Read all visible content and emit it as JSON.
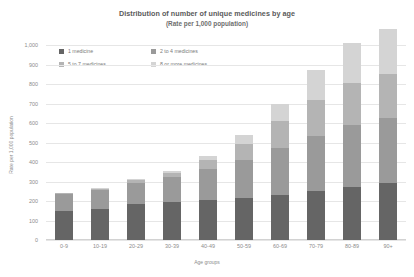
{
  "chart_data": {
    "type": "bar",
    "stacked": true,
    "title": "Distribution of number of unique medicines by age",
    "subtitle": "(Rate per 1,000 population)",
    "xlabel": "Age groups",
    "ylabel": "Rate per 1,000 population",
    "ylim": [
      0,
      1000
    ],
    "yticks": [
      0,
      100,
      200,
      300,
      400,
      500,
      600,
      700,
      800,
      900,
      1000
    ],
    "ytick_labels": [
      "0",
      "100",
      "200",
      "300",
      "400",
      "500",
      "600",
      "700",
      "800",
      "900",
      "1,000"
    ],
    "grid": true,
    "legend_position": "top-left",
    "categories": [
      "0-9",
      "10-19",
      "20-29",
      "30-39",
      "40-49",
      "50-59",
      "60-69",
      "70-79",
      "80-89",
      "90+"
    ],
    "series": [
      {
        "name": "1 medicine",
        "color": "#656565",
        "values": [
          150,
          160,
          185,
          195,
          205,
          215,
          230,
          250,
          270,
          290
        ]
      },
      {
        "name": "2 to 4 medicines",
        "color": "#9a9a9a",
        "values": [
          85,
          95,
          110,
          130,
          160,
          195,
          240,
          285,
          320,
          335
        ]
      },
      {
        "name": "5 to 7 medicines",
        "color": "#b4b4b4",
        "values": [
          5,
          8,
          12,
          20,
          45,
          85,
          140,
          185,
          215,
          225
        ]
      },
      {
        "name": "8 or more medicines",
        "color": "#d4d4d4",
        "values": [
          2,
          3,
          5,
          8,
          20,
          45,
          90,
          150,
          205,
          230
        ]
      }
    ],
    "totals": [
      242,
      266,
      312,
      353,
      430,
      540,
      700,
      870,
      1010,
      1080
    ]
  },
  "legend": {
    "items": [
      {
        "label": "1 medicine",
        "color": "#656565"
      },
      {
        "label": "2 to 4 medicines",
        "color": "#9a9a9a"
      },
      {
        "label": "5 to 7 medicines",
        "color": "#b4b4b4"
      },
      {
        "label": "8 or more medicines",
        "color": "#d4d4d4"
      }
    ]
  },
  "colors": {
    "gridline": "#e6e6e6",
    "text": "#8c8c8c",
    "title": "#5a5a5a",
    "background": "#ffffff"
  }
}
